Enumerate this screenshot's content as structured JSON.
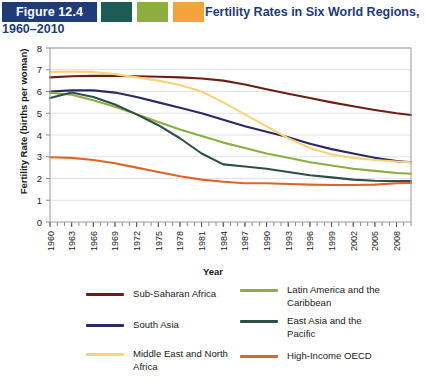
{
  "header": {
    "figure_badge": "Figure 12.4",
    "title_line1": "Fertility Rates in Six World Regions,",
    "title_line2": "1960–2010",
    "swatch_colors": [
      "#1b5c57",
      "#8cae40",
      "#f2a33c"
    ],
    "badge_color": "#1f3b78",
    "title_color": "#1f3b78"
  },
  "axes": {
    "ylabel": "Fertility Rate (births per woman)",
    "xlabel": "Year",
    "yticks": [
      0,
      1,
      2,
      3,
      4,
      5,
      6,
      7,
      8
    ],
    "xticks": [
      "1960",
      "1963",
      "1966",
      "1969",
      "1972",
      "1975",
      "1978",
      "1981",
      "1984",
      "1987",
      "1990",
      "1993",
      "1996",
      "1999",
      "2002",
      "2005",
      "2008"
    ]
  },
  "legend": {
    "items": [
      {
        "label": "Sub-Saharan Africa",
        "color": "#6b1f16",
        "col": 1,
        "row": 1
      },
      {
        "label": "South Asia",
        "color": "#2b2a62",
        "col": 1,
        "row": 2
      },
      {
        "label": "Middle East and North\nAfrica",
        "color": "#fbd277",
        "col": 1,
        "row": 3
      },
      {
        "label": "Latin America and the\nCaribbean",
        "color": "#8cae40",
        "col": 2,
        "row": 1
      },
      {
        "label": "East Asia and the\nPacific",
        "color": "#2c4f4c",
        "col": 2,
        "row": 2
      },
      {
        "label": "High-Income OECD",
        "color": "#e0642a",
        "col": 2,
        "row": 3
      }
    ]
  },
  "chart_data": {
    "type": "line",
    "title": "Fertility Rates in Six World Regions, 1960–2010",
    "xlabel": "Year",
    "ylabel": "Fertility Rate (births per woman)",
    "xlim": [
      1960,
      2010
    ],
    "ylim": [
      0,
      8
    ],
    "grid": "horizontal",
    "legend_position": "bottom",
    "x": [
      1960,
      1963,
      1966,
      1969,
      1972,
      1975,
      1978,
      1981,
      1984,
      1987,
      1990,
      1993,
      1996,
      1999,
      2002,
      2005,
      2008,
      2010
    ],
    "series": [
      {
        "name": "Sub-Saharan Africa",
        "color": "#6b1f16",
        "values": [
          6.65,
          6.7,
          6.72,
          6.72,
          6.7,
          6.68,
          6.65,
          6.6,
          6.5,
          6.32,
          6.1,
          5.9,
          5.7,
          5.5,
          5.32,
          5.15,
          5.0,
          4.92
        ]
      },
      {
        "name": "South Asia",
        "color": "#2b2a62",
        "values": [
          6.0,
          6.05,
          6.05,
          5.95,
          5.75,
          5.5,
          5.25,
          5.0,
          4.7,
          4.4,
          4.15,
          3.9,
          3.6,
          3.35,
          3.15,
          2.95,
          2.8,
          2.75
        ]
      },
      {
        "name": "Middle East and North Africa",
        "color": "#fbd277",
        "values": [
          6.9,
          6.92,
          6.9,
          6.8,
          6.65,
          6.5,
          6.3,
          6.0,
          5.5,
          4.95,
          4.4,
          3.85,
          3.4,
          3.1,
          2.95,
          2.85,
          2.78,
          2.75
        ]
      },
      {
        "name": "Latin America and the Caribbean",
        "color": "#8cae40",
        "values": [
          5.95,
          5.85,
          5.6,
          5.3,
          4.95,
          4.6,
          4.25,
          3.95,
          3.65,
          3.4,
          3.15,
          2.95,
          2.75,
          2.6,
          2.45,
          2.35,
          2.25,
          2.22
        ]
      },
      {
        "name": "East Asia and the Pacific",
        "color": "#2c4f4c",
        "values": [
          5.7,
          5.95,
          5.75,
          5.4,
          4.95,
          4.45,
          3.85,
          3.15,
          2.65,
          2.55,
          2.45,
          2.3,
          2.15,
          2.05,
          1.95,
          1.9,
          1.88,
          1.88
        ]
      },
      {
        "name": "High-Income OECD",
        "color": "#e0642a",
        "values": [
          2.98,
          2.95,
          2.85,
          2.7,
          2.5,
          2.3,
          2.1,
          1.95,
          1.85,
          1.78,
          1.78,
          1.75,
          1.72,
          1.7,
          1.7,
          1.72,
          1.78,
          1.8
        ]
      }
    ]
  }
}
